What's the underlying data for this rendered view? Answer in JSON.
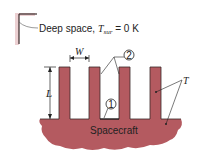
{
  "diagram": {
    "environment_label": {
      "prefix": "Deep space, ",
      "symbol": "T",
      "subscript": "sur",
      "suffix": " = 0 K"
    },
    "dimension_labels": {
      "width": "W",
      "length": "L"
    },
    "surface_markers": [
      "1",
      "2"
    ],
    "temperature_label": "T",
    "body_label": "Spacecraft",
    "fin_count": 4,
    "colors": {
      "body": "#b45a60",
      "outline": "#3a2a2a",
      "corner_shadow": "#e6c4c6",
      "text": "#222222"
    }
  }
}
